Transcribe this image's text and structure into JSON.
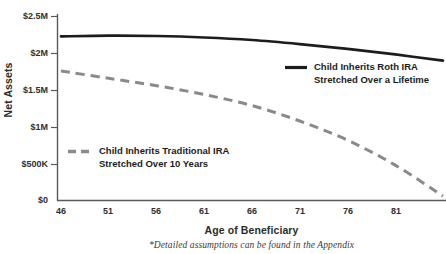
{
  "chart_data": {
    "type": "line",
    "title": "",
    "xlabel": "Age of Beneficiary",
    "ylabel": "Net Assets",
    "footnote": "*Detailed assumptions can be found in the Appendix",
    "xlim": [
      46,
      86
    ],
    "ylim": [
      0,
      2500000
    ],
    "grid": false,
    "legend_position": "inside",
    "x_ticks": [
      "46",
      "51",
      "56",
      "61",
      "66",
      "71",
      "76",
      "81"
    ],
    "x_tick_values": [
      46,
      51,
      56,
      61,
      66,
      71,
      76,
      81
    ],
    "y_ticks": [
      "$0",
      "$500K",
      "$1M",
      "$1.5M",
      "$2M",
      "$2.5M"
    ],
    "y_tick_values": [
      0,
      500000,
      1000000,
      1500000,
      2000000,
      2500000
    ],
    "x": [
      46,
      51,
      56,
      61,
      66,
      71,
      76,
      81,
      86
    ],
    "series": [
      {
        "name": "Child Inherits Roth IRA Stretched Over a Lifetime",
        "style": "solid",
        "color": "#1c1c1c",
        "values": [
          2230000,
          2240000,
          2235000,
          2215000,
          2180000,
          2125000,
          2060000,
          1985000,
          1900000
        ]
      },
      {
        "name": "Child Inherits Traditional IRA Stretched Over 10 Years",
        "style": "dashed",
        "color": "#8a8a8a",
        "values": [
          1760000,
          1660000,
          1560000,
          1440000,
          1290000,
          1080000,
          820000,
          480000,
          60000
        ]
      }
    ],
    "legend": [
      {
        "marker": "solid-line-marker",
        "color": "#1c1c1c",
        "line1": "Child Inherits Roth IRA",
        "line2": "Stretched Over a Lifetime"
      },
      {
        "marker": "dashed-line-marker",
        "color": "#8a8a8a",
        "line1": "Child Inherits Traditional IRA",
        "line2": "Stretched Over 10 Years"
      }
    ]
  }
}
